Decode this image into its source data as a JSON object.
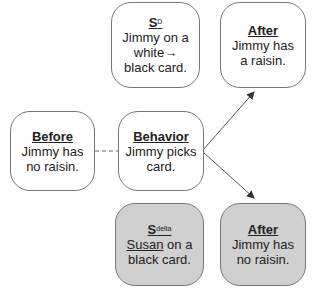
{
  "boxes": {
    "sd": {
      "title": "S",
      "sup": "D",
      "line1": "Jimmy on a",
      "line2": "white→",
      "line3": "black card."
    },
    "after_top": {
      "title": "After",
      "line1": "Jimmy has",
      "line2": "a raisin."
    },
    "before": {
      "title": "Before",
      "line1": "Jimmy has",
      "line2": "no raisin."
    },
    "behavior": {
      "title": "Behavior",
      "line1": "Jimmy picks",
      "line2": "card."
    },
    "sdelta": {
      "title": "S",
      "sup": "delta",
      "name": "Susan",
      "line1_rest": " on a",
      "line2": "black card."
    },
    "after_bottom": {
      "title": "After",
      "line1": "Jimmy has",
      "line2": "no raisin."
    }
  },
  "colors": {
    "shaded": "#d0d0d0",
    "border": "#777777",
    "arrow": "#444444"
  }
}
